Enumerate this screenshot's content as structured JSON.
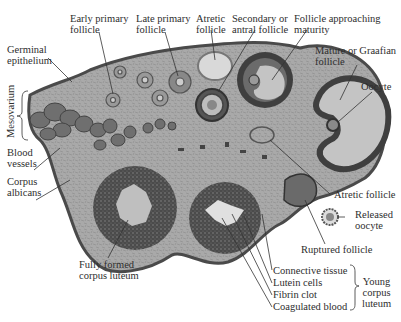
{
  "diagram": {
    "colors": {
      "stroma": "#a9a9a9",
      "stroma_dark": "#5e5e5e",
      "antrum_fluid": "#c4c4c4",
      "corpus_luteum": "#4d4d4d",
      "blood_vessel": "#6f6f6f",
      "line": "#333333",
      "background": "#ffffff"
    },
    "labels": {
      "early_primary_follicle": "Early primary\nfollicle",
      "late_primary_follicle": "Late primary\nfollicle",
      "atretic_follicle_top": "Atretic\nfollicle",
      "secondary_antral_follicle": "Secondary or\nantral follicle",
      "follicle_approaching_maturity": "Follicle approaching\nmaturity",
      "germinal_epithelium": "Germinal\nepithelium",
      "mature_graafian_follicle": "Mature or Graafian\nfollicle",
      "oocyte": "Oocyte",
      "mesovarium": "Mesovarium",
      "blood_vessels": "Blood\nvessels",
      "corpus_albicans": "Corpus\nalbicans",
      "atretic_follicle_right": "Atretic follicle",
      "released_oocyte": "Released\noocyte",
      "ruptured_follicle": "Ruptured follicle",
      "fully_formed_corpus_luteum": "Fully formed\ncorpus luteum",
      "connective_tissue": "Connective tissue",
      "lutein_cells": "Lutein cells",
      "fibrin_clot": "Fibrin clot",
      "coagulated_blood": "Coagulated blood",
      "young_corpus_luteum": "Young\ncorpus\nluteum"
    }
  }
}
